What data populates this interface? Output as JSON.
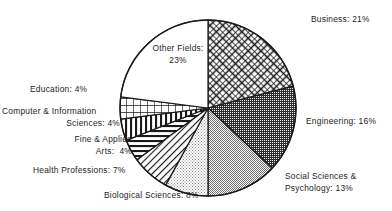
{
  "chart_data": {
    "type": "pie",
    "title": "",
    "subtitle": "",
    "xlabel": "",
    "ylabel": "",
    "legend_position": "none",
    "grid": false,
    "start_angle_deg": 0,
    "direction": "clockwise",
    "units": "percent",
    "total": 100,
    "categories": [
      "Business",
      "Engineering",
      "Social Sciences & Psychology",
      "Biological Sciences",
      "Health Professions",
      "Fine & Applied Arts",
      "Computer & Information Sciences",
      "Education",
      "Other Fields"
    ],
    "values": [
      21,
      16,
      13,
      8,
      7,
      4,
      4,
      4,
      23
    ],
    "slices": [
      {
        "name": "Business",
        "value": 21,
        "label": "Business:",
        "value_label": "21%",
        "label_full": "Business: 21%",
        "pattern": "diagonal-crosshatch",
        "fill": "#ffffff",
        "ink": "#1a1a1a"
      },
      {
        "name": "Engineering",
        "value": 16,
        "label": "Engineering:",
        "value_label": "16%",
        "label_full": "Engineering: 16%",
        "pattern": "dense-dark-stipple",
        "fill": "#3f3f3f",
        "ink": "#1a1a1a"
      },
      {
        "name": "Social Sciences & Psychology",
        "value": 13,
        "label_line1": "Social Sciences &",
        "label_line2": "Psychology: 13%",
        "value_label": "13%",
        "label_full": "Social Sciences & Psychology: 13%",
        "pattern": "medium-stipple",
        "fill": "#9a9a9a",
        "ink": "#1a1a1a"
      },
      {
        "name": "Biological Sciences",
        "value": 8,
        "label": "Biological Sciences:",
        "value_label": "8%",
        "label_full": "Biological Sciences: 8%",
        "pattern": "light-stipple",
        "fill": "#c4c4c4",
        "ink": "#1a1a1a"
      },
      {
        "name": "Health Professions",
        "value": 7,
        "label": "Health Professions:",
        "value_label": "7%",
        "label_full": "Health Professions: 7%",
        "pattern": "diagonal-hatch",
        "fill": "#ffffff",
        "ink": "#1a1a1a"
      },
      {
        "name": "Fine & Applied Arts",
        "value": 4,
        "label_line1": "Fine & Applied",
        "label_line2": "Arts:  4%",
        "value_label": "4%",
        "label_full": "Fine & Applied Arts: 4%",
        "pattern": "horizontal-lines",
        "fill": "#ffffff",
        "ink": "#1a1a1a"
      },
      {
        "name": "Computer & Information Sciences",
        "value": 4,
        "label_line1": "Computer & Information",
        "label_line2": "Sciences: 4%",
        "value_label": "4%",
        "label_full": "Computer & Information Sciences: 4%",
        "pattern": "vertical-lines",
        "fill": "#ffffff",
        "ink": "#1a1a1a"
      },
      {
        "name": "Education",
        "value": 4,
        "label": "Education:",
        "value_label": "4%",
        "label_full": "Education: 4%",
        "pattern": "grid-crosshatch",
        "fill": "#ffffff",
        "ink": "#1a1a1a"
      },
      {
        "name": "Other Fields",
        "value": 23,
        "label_line1": "Other Fields:",
        "label_line2": "23%",
        "value_label": "23%",
        "label_full": "Other Fields: 23%",
        "pattern": "solid-white",
        "fill": "#ffffff",
        "ink": "#1a1a1a"
      }
    ]
  },
  "labels": {
    "business": "Business: 21%",
    "engineering": "Engineering: 16%",
    "social_line1": "Social Sciences &",
    "social_line2": "Psychology: 13%",
    "biological": "Biological Sciences: 8%",
    "health": "Health Professions: 7%",
    "fine_arts_line1": "Fine & Applied",
    "fine_arts_line2": "Arts:  4%",
    "computer_line1": "Computer & Information",
    "computer_line2": "Sciences: 4%",
    "education": "Education: 4%",
    "other_line1": "Other Fields:",
    "other_line2": "23%"
  },
  "colors": {
    "ink": "#1a1a1a",
    "background": "#ffffff",
    "engineering_fill": "#3f3f3f",
    "social_fill": "#9a9a9a",
    "biological_fill": "#c4c4c4"
  }
}
